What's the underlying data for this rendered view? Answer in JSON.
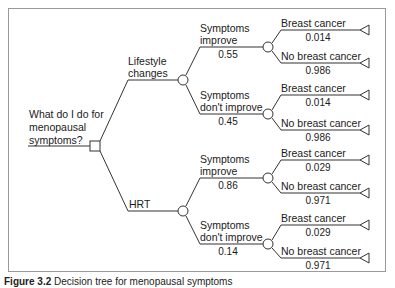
{
  "question": {
    "line1": "What do I do for",
    "line2": "menopausal",
    "line3": "symptoms?"
  },
  "options": [
    {
      "label_line1": "Lifestyle",
      "label_line2": "changes",
      "branches": [
        {
          "label_line1": "Symptoms",
          "label_line2": "improve",
          "probability": "0.55",
          "outcomes": [
            {
              "label": "Breast cancer",
              "probability": "0.014"
            },
            {
              "label": "No breast cancer",
              "probability": "0.986"
            }
          ]
        },
        {
          "label_line1": "Symptoms",
          "label_line2": "don't improve",
          "probability": "0.45",
          "outcomes": [
            {
              "label": "Breast cancer",
              "probability": "0.014"
            },
            {
              "label": "No breast cancer",
              "probability": "0.986"
            }
          ]
        }
      ]
    },
    {
      "label_line1": "HRT",
      "label_line2": "",
      "branches": [
        {
          "label_line1": "Symptoms",
          "label_line2": "improve",
          "probability": "0.86",
          "outcomes": [
            {
              "label": "Breast cancer",
              "probability": "0.029"
            },
            {
              "label": "No breast cancer",
              "probability": "0.971"
            }
          ]
        },
        {
          "label_line1": "Symptoms",
          "label_line2": "don't improve",
          "probability": "0.14",
          "outcomes": [
            {
              "label": "Breast cancer",
              "probability": "0.029"
            },
            {
              "label": "No breast cancer",
              "probability": "0.971"
            }
          ]
        }
      ]
    }
  ],
  "caption": {
    "prefix": "Figure 3.2",
    "text": "Decision tree for menopausal symptoms"
  },
  "colors": {
    "line": "#333333",
    "frame": "#9a9a9a"
  }
}
